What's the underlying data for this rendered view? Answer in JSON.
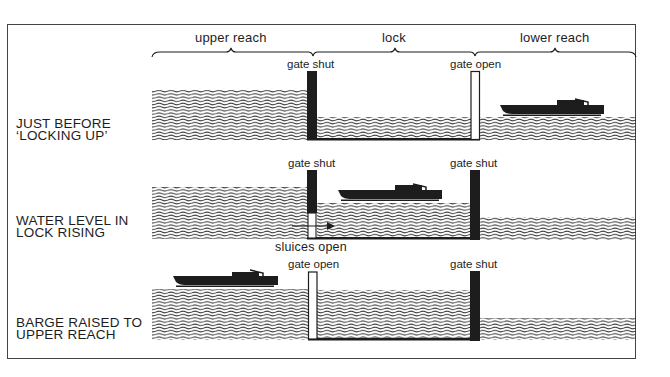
{
  "diagram": {
    "type": "canal lock operation sequence",
    "colors": {
      "ink": "#1d1d1d",
      "water_lines": "#2a2a2a",
      "gate_shut": "#1d1d1d",
      "gate_open": "#ffffff",
      "background": "#ffffff"
    },
    "sections": [
      {
        "id": "upper",
        "label": "upper reach"
      },
      {
        "id": "lock",
        "label": "lock"
      },
      {
        "id": "lower",
        "label": "lower reach"
      }
    ],
    "panels": [
      {
        "stage_label_line1": "JUST BEFORE",
        "stage_label_line2": "‘LOCKING UP’",
        "left_gate": "gate shut",
        "right_gate": "gate open",
        "annotation": "",
        "barge_position": "lower reach",
        "lock_water_level": "low"
      },
      {
        "stage_label_line1": "WATER LEVEL IN",
        "stage_label_line2": "LOCK RISING",
        "left_gate": "gate shut",
        "right_gate": "gate shut",
        "annotation": "sluices open",
        "barge_position": "lock",
        "lock_water_level": "rising"
      },
      {
        "stage_label_line1": "BARGE RAISED TO",
        "stage_label_line2": "UPPER REACH",
        "left_gate": "gate open",
        "right_gate": "gate shut",
        "annotation": "",
        "barge_position": "upper reach",
        "lock_water_level": "high"
      }
    ]
  }
}
